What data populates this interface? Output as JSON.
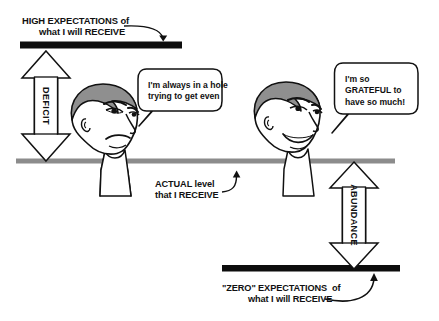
{
  "figure": {
    "title_cutoff_fragment": "",
    "background_color": "#ffffff",
    "ink_color": "#111111",
    "bar_color": "#0d0d0d",
    "baseline_color": "#8c8c8c",
    "hair_color": "#8f8f8f"
  },
  "labels": {
    "high_expectations": {
      "line1": "HIGH EXPECTATIONS of",
      "line2": "what I will RECEIVE"
    },
    "actual_level": {
      "line1": "ACTUAL level",
      "line2": "that I RECEIVE"
    },
    "zero_expectations": {
      "line1": "\"ZERO\" EXPECTATIONS  of",
      "line2": "what I will RECEIVE"
    },
    "deficit": "DEFICIT",
    "abundance": "ABUNDANCE"
  },
  "speech": {
    "left": {
      "line1": "I'm always in a hole",
      "line2": "trying to get even"
    },
    "right": {
      "line1": "I'm so",
      "line2": "GRATEFUL to",
      "line3": "have so much!"
    }
  }
}
